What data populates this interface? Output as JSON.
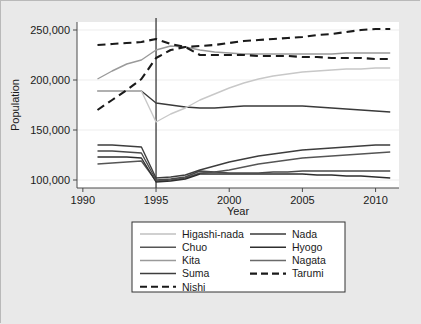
{
  "chart_data": {
    "type": "line",
    "title": "",
    "xlabel": "Year",
    "ylabel": "Population",
    "xlim": [
      1989.6,
      2011.6
    ],
    "ylim": [
      92000,
      258000
    ],
    "xticks": [
      1990,
      1995,
      2000,
      2005,
      2010
    ],
    "xtick_labels": [
      "1990",
      "1995",
      "2000",
      "2005",
      "2010"
    ],
    "yticks": [
      100000,
      150000,
      200000,
      250000
    ],
    "ytick_labels": [
      "100,000",
      "150,000",
      "200,000",
      "250,000"
    ],
    "grid": "horizontal-light",
    "legend_position": "below-axes",
    "legend_columns": 2,
    "annotations": [
      {
        "name": "earthquake-reference-line",
        "type": "vline",
        "x": 1995,
        "label": ""
      }
    ],
    "x": [
      1991,
      1992,
      1993,
      1994,
      1995,
      1996,
      1997,
      1998,
      1999,
      2000,
      2001,
      2002,
      2003,
      2004,
      2005,
      2006,
      2007,
      2008,
      2009,
      2010,
      2011
    ],
    "series": [
      {
        "name": "Higashi-nada",
        "style": "solid",
        "color": "#9a9a9a",
        "values": [
          201000,
          209000,
          216000,
          220000,
          230000,
          234000,
          233000,
          230000,
          228000,
          227000,
          226000,
          226000,
          226000,
          226000,
          226000,
          226000,
          226000,
          227000,
          227000,
          227000,
          227000
        ]
      },
      {
        "name": "Nada",
        "style": "solid",
        "color": "#3a3a3a",
        "values": [
          189000,
          189000,
          189000,
          189000,
          177000,
          175000,
          173000,
          172000,
          172000,
          173000,
          174000,
          174000,
          174000,
          174000,
          174000,
          173000,
          172000,
          171000,
          170000,
          169000,
          168000
        ]
      },
      {
        "name": "Chuo",
        "style": "solid",
        "color": "#555555",
        "values": [
          116000,
          117000,
          118000,
          119000,
          99000,
          100000,
          102000,
          107000,
          108000,
          110000,
          113000,
          116000,
          118000,
          120000,
          122000,
          123000,
          124000,
          125000,
          126000,
          127000,
          128000
        ]
      },
      {
        "name": "Hyogo",
        "style": "solid",
        "color": "#2e2e2e",
        "values": [
          123000,
          123000,
          123000,
          122000,
          98000,
          99000,
          101000,
          106000,
          106000,
          106000,
          106000,
          106000,
          106000,
          106000,
          106000,
          105000,
          105000,
          104000,
          104000,
          103000,
          102000
        ]
      },
      {
        "name": "Kita",
        "style": "solid",
        "color": "#c8c8c8",
        "values": [
          189000,
          189000,
          189000,
          189000,
          158000,
          166000,
          172000,
          180000,
          186000,
          192000,
          197000,
          201000,
          204000,
          206000,
          208000,
          209000,
          210000,
          211000,
          211000,
          212000,
          212000
        ]
      },
      {
        "name": "Nagata",
        "style": "solid",
        "color": "#4a4a4a",
        "values": [
          129000,
          129000,
          128000,
          127000,
          100000,
          101000,
          103000,
          109000,
          108000,
          107000,
          107000,
          107000,
          108000,
          108000,
          109000,
          109000,
          109000,
          109000,
          109000,
          109000,
          109000
        ]
      },
      {
        "name": "Suma",
        "style": "solid",
        "color": "#3d3d3d",
        "values": [
          135000,
          135000,
          134000,
          133000,
          102000,
          103000,
          105000,
          110000,
          114000,
          118000,
          121000,
          124000,
          126000,
          128000,
          130000,
          131000,
          132000,
          133000,
          134000,
          135000,
          135000
        ]
      },
      {
        "name": "Nishi",
        "style": "dashed",
        "color": "#1a1a1a",
        "values": [
          170000,
          180000,
          190000,
          201000,
          222000,
          230000,
          233000,
          234000,
          235000,
          237000,
          239000,
          240000,
          241000,
          242000,
          243000,
          245000,
          246000,
          248000,
          250000,
          251000,
          251000
        ]
      },
      {
        "name": "Tarumi",
        "style": "dashed",
        "color": "#1a1a1a",
        "values": [
          235000,
          236000,
          237000,
          238000,
          241000,
          236000,
          233000,
          225000,
          225000,
          225000,
          225000,
          224000,
          224000,
          224000,
          223000,
          223000,
          222000,
          222000,
          222000,
          221000,
          221000
        ]
      }
    ],
    "legend_entries": [
      {
        "label": "Higashi-nada",
        "style": "solid",
        "color": "#c0c0c0"
      },
      {
        "label": "Nada",
        "style": "solid",
        "color": "#3a3a3a"
      },
      {
        "label": "Chuo",
        "style": "solid",
        "color": "#555555"
      },
      {
        "label": "Hyogo",
        "style": "solid",
        "color": "#2e2e2e"
      },
      {
        "label": "Kita",
        "style": "solid",
        "color": "#9a9a9a"
      },
      {
        "label": "Nagata",
        "style": "solid",
        "color": "#6a6a6a"
      },
      {
        "label": "Suma",
        "style": "solid",
        "color": "#3d3d3d"
      },
      {
        "label": "Tarumi",
        "style": "dashed",
        "color": "#1a1a1a"
      },
      {
        "label": "Nishi",
        "style": "dashed",
        "color": "#1a1a1a"
      }
    ]
  },
  "axes": {
    "ylabel": "Population",
    "xlabel": "Year"
  }
}
